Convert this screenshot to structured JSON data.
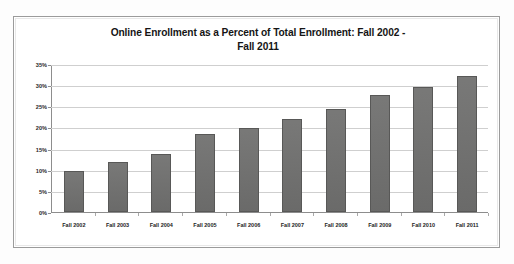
{
  "chart_data": {
    "type": "bar",
    "title": "Online Enrollment as a Percent of Total Enrollment: Fall 2002 - Fall 2011",
    "title_line1": "Online Enrollment as a Percent of Total Enrollment: Fall 2002 -",
    "title_line2": "Fall 2011",
    "xlabel": "",
    "ylabel": "",
    "categories": [
      "Fall 2002",
      "Fall 2003",
      "Fall 2004",
      "Fall 2005",
      "Fall 2006",
      "Fall 2007",
      "Fall 2008",
      "Fall 2009",
      "Fall 2010",
      "Fall 2011"
    ],
    "values": [
      9.6,
      11.7,
      13.6,
      18.3,
      19.8,
      21.8,
      24.3,
      27.5,
      29.4,
      32.1
    ],
    "value_labels": [
      "9.6%",
      "11.7%",
      "13.6%",
      "18.3%",
      "19.8%",
      "21.8%",
      "24.3%",
      "27.5%",
      "29.4%",
      "32.1%"
    ],
    "ylim": [
      0,
      35
    ],
    "ytick_values": [
      0,
      5,
      10,
      15,
      20,
      25,
      30,
      35
    ],
    "ytick_labels": [
      "0%",
      "5%",
      "10%",
      "15%",
      "20%",
      "25%",
      "30%",
      "35%"
    ],
    "grid": true,
    "grid_axis": "y",
    "legend": false,
    "legend_position": "none",
    "series": [
      {
        "name": "Online Enrollment as a Percent of Total Enrollment",
        "values": [
          9.6,
          11.7,
          13.6,
          18.3,
          19.8,
          21.8,
          24.3,
          27.5,
          29.4,
          32.1
        ]
      }
    ],
    "colors": {
      "bar_fill": "#70706f",
      "bar_border": "#585857",
      "gridline": "#cfcfcf",
      "axis": "#8d8d8d",
      "frame_border": "#9b9b9b",
      "title_text": "#151515",
      "tick_text": "#1d1d1d",
      "plot_background": "#ffffff"
    }
  }
}
